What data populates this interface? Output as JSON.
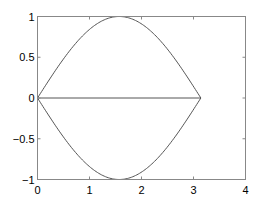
{
  "chart_data": {
    "type": "line",
    "title": "",
    "xlabel": "",
    "ylabel": "",
    "xlim": [
      0,
      4
    ],
    "ylim": [
      -1,
      1
    ],
    "grid": false,
    "legend": null,
    "xticks": [
      0,
      1,
      2,
      3,
      4
    ],
    "xtick_labels": [
      "0",
      "1",
      "2",
      "3",
      "4"
    ],
    "yticks": [
      -1,
      -0.5,
      0,
      0.5,
      1
    ],
    "ytick_labels": [
      "−1",
      "−0.5",
      "0",
      "0.5",
      "1"
    ],
    "series": [
      {
        "name": "sin(x)",
        "x_range": [
          0,
          3.1416
        ],
        "function": "sin(x)",
        "color": "#555555",
        "x": [
          0,
          0.5,
          1.0,
          1.5708,
          2.0,
          2.5,
          3.1416
        ],
        "y": [
          0,
          0.479,
          0.841,
          1.0,
          0.909,
          0.598,
          0
        ]
      },
      {
        "name": "-sin(x)",
        "x_range": [
          0,
          3.1416
        ],
        "function": "-sin(x)",
        "color": "#555555",
        "x": [
          0,
          0.5,
          1.0,
          1.5708,
          2.0,
          2.5,
          3.1416
        ],
        "y": [
          0,
          -0.479,
          -0.841,
          -1.0,
          -0.909,
          -0.598,
          0
        ]
      },
      {
        "name": "zero line",
        "x": [
          0,
          3.1416
        ],
        "y": [
          0,
          0
        ],
        "color": "#555555"
      }
    ]
  },
  "axes": {
    "frame_color": "#888888",
    "line_color": "#555555"
  }
}
